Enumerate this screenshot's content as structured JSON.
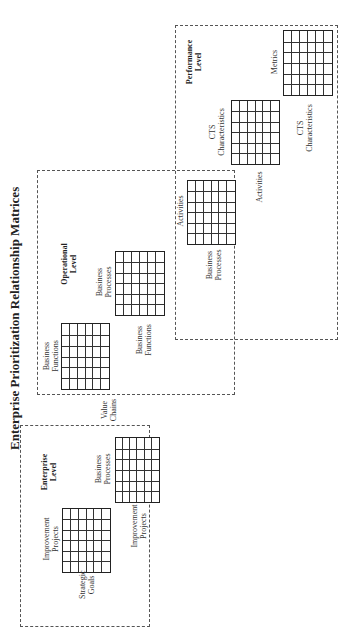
{
  "title": "Enterprise Prioritization Relationship Matrices",
  "levels": {
    "enterprise": {
      "label_line1": "Enterprise",
      "label_line2": "Level",
      "matrices": [
        {
          "top_label": [
            "Improvement",
            "Projects"
          ],
          "side_label": [
            "Strategic",
            "Goals"
          ],
          "rows": 6,
          "cols": 6
        },
        {
          "top_label": [
            "Business",
            "Processes"
          ],
          "side_label": [
            "Improvement",
            "Projects"
          ],
          "rows": 6,
          "cols": 6
        }
      ]
    },
    "operational": {
      "label_line1": "Operational",
      "label_line2": "Level",
      "matrices": [
        {
          "top_label": [
            "Business",
            "Functions"
          ],
          "side_label": [
            "Value",
            "Chains"
          ],
          "rows": 6,
          "cols": 6
        },
        {
          "top_label": [
            "Business",
            "Processes"
          ],
          "side_label": [
            "Business",
            "Functions"
          ],
          "rows": 6,
          "cols": 6
        }
      ]
    },
    "performance": {
      "label_line1": "Performance",
      "label_line2": "Level",
      "matrices": [
        {
          "top_label": [
            "Activities"
          ],
          "side_label": [
            "Business",
            "Processes"
          ],
          "rows": 6,
          "cols": 6
        },
        {
          "top_label": [
            "CTS",
            "Characteristics"
          ],
          "side_label": [
            "Activities"
          ],
          "rows": 6,
          "cols": 6
        },
        {
          "top_label": [
            "Metrics"
          ],
          "side_label": [
            "CTS",
            "Characteristics"
          ],
          "rows": 6,
          "cols": 6
        }
      ]
    }
  }
}
